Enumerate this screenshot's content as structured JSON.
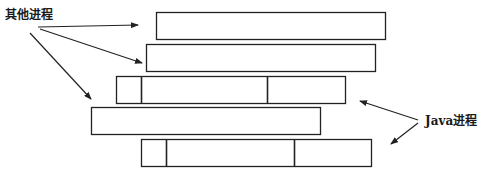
{
  "labels": {
    "other_processes": "其他进程",
    "java_processes": "Java进程"
  },
  "colors": {
    "stroke": "#222222",
    "background": "#ffffff",
    "text": "#1a1a1a"
  },
  "process_bars": [
    {
      "id": "bar-1",
      "type": "other",
      "x": 156,
      "y": 12,
      "w": 229,
      "h": 27,
      "dividers": []
    },
    {
      "id": "bar-2",
      "type": "other",
      "x": 146,
      "y": 44,
      "w": 229,
      "h": 27,
      "dividers": []
    },
    {
      "id": "bar-3",
      "type": "java",
      "x": 116,
      "y": 76,
      "w": 229,
      "h": 27,
      "dividers": [
        141,
        267
      ]
    },
    {
      "id": "bar-4",
      "type": "other",
      "x": 91,
      "y": 107,
      "w": 229,
      "h": 27,
      "dividers": []
    },
    {
      "id": "bar-5",
      "type": "java",
      "x": 141,
      "y": 139,
      "w": 230,
      "h": 27,
      "dividers": [
        166,
        294
      ]
    }
  ],
  "arrows": [
    {
      "id": "arrow-other-1",
      "from": [
        38,
        27
      ],
      "to": [
        138,
        25
      ]
    },
    {
      "id": "arrow-other-2",
      "from": [
        40,
        29
      ],
      "to": [
        142,
        63
      ]
    },
    {
      "id": "arrow-other-3",
      "from": [
        30,
        33
      ],
      "to": [
        91,
        99
      ]
    },
    {
      "id": "arrow-java-1",
      "from": [
        418,
        120
      ],
      "to": [
        360,
        101
      ]
    },
    {
      "id": "arrow-java-2",
      "from": [
        418,
        123
      ],
      "to": [
        391,
        144
      ]
    }
  ]
}
